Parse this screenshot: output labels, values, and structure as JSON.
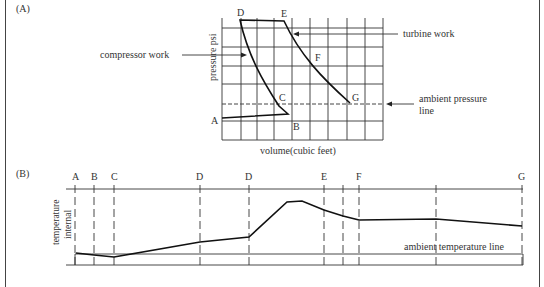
{
  "panel_a": {
    "label": "(A)",
    "y_axis_label": "pressure psi",
    "x_axis_label": "volume(cubic feet)",
    "annotations": {
      "compressor_work": "compressor work",
      "turbine_work": "turbine work",
      "ambient_pressure_line_1": "ambient pressure",
      "ambient_pressure_line_2": "line"
    },
    "points": {
      "A": "A",
      "B": "B",
      "C": "C",
      "D": "D",
      "E": "E",
      "F": "F",
      "G": "G"
    }
  },
  "panel_b": {
    "label": "(B)",
    "y_axis_label_1": "temperature",
    "y_axis_label_2": "internal",
    "annotation": "ambient temperature line",
    "stations": [
      "A",
      "B",
      "C",
      "D",
      "D",
      "E",
      "F",
      "G"
    ]
  },
  "colors": {
    "line": "#222222",
    "grid": "#333333",
    "text": "#333333",
    "background": "#ffffff"
  }
}
